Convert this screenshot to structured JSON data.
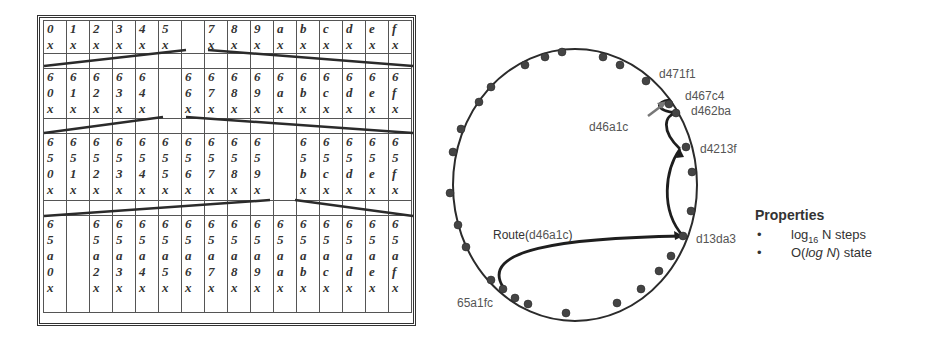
{
  "routing_table": {
    "columns": 16,
    "rows": [
      {
        "level": 0,
        "cells": [
          [
            "0",
            "x"
          ],
          [
            "1",
            "x"
          ],
          [
            "2",
            "x"
          ],
          [
            "3",
            "x"
          ],
          [
            "4",
            "x"
          ],
          [
            "5",
            "x"
          ],
          [],
          [
            "7",
            "x"
          ],
          [
            "8",
            "x"
          ],
          [
            "9",
            "x"
          ],
          [
            "a",
            "x"
          ],
          [
            "b",
            "x"
          ],
          [
            "c",
            "x"
          ],
          [
            "d",
            "x"
          ],
          [
            "e",
            "x"
          ],
          [
            "f",
            "x"
          ]
        ]
      },
      {
        "level": 1,
        "cells": [
          [
            "6",
            "0",
            "x"
          ],
          [
            "6",
            "1",
            "x"
          ],
          [
            "6",
            "2",
            "x"
          ],
          [
            "6",
            "3",
            "x"
          ],
          [
            "6",
            "4",
            "x"
          ],
          [],
          [
            "6",
            "6",
            "x"
          ],
          [
            "6",
            "7",
            "x"
          ],
          [
            "6",
            "8",
            "x"
          ],
          [
            "6",
            "9",
            "x"
          ],
          [
            "6",
            "a",
            "x"
          ],
          [
            "6",
            "b",
            "x"
          ],
          [
            "6",
            "c",
            "x"
          ],
          [
            "6",
            "d",
            "x"
          ],
          [
            "6",
            "e",
            "x"
          ],
          [
            "6",
            "f",
            "x"
          ]
        ]
      },
      {
        "level": 2,
        "cells": [
          [
            "6",
            "5",
            "0",
            "x"
          ],
          [
            "6",
            "5",
            "1",
            "x"
          ],
          [
            "6",
            "5",
            "2",
            "x"
          ],
          [
            "6",
            "5",
            "3",
            "x"
          ],
          [
            "6",
            "5",
            "4",
            "x"
          ],
          [
            "6",
            "5",
            "5",
            "x"
          ],
          [
            "6",
            "5",
            "6",
            "x"
          ],
          [
            "6",
            "5",
            "7",
            "x"
          ],
          [
            "6",
            "5",
            "8",
            "x"
          ],
          [
            "6",
            "5",
            "9",
            "x"
          ],
          [],
          [
            "6",
            "5",
            "b",
            "x"
          ],
          [
            "6",
            "5",
            "c",
            "x"
          ],
          [
            "6",
            "5",
            "d",
            "x"
          ],
          [
            "6",
            "5",
            "e",
            "x"
          ],
          [
            "6",
            "5",
            "f",
            "x"
          ]
        ]
      },
      {
        "level": 3,
        "cells": [
          [
            "6",
            "5",
            "a",
            "0",
            "x"
          ],
          [],
          [
            "6",
            "5",
            "a",
            "2",
            "x"
          ],
          [
            "6",
            "5",
            "a",
            "3",
            "x"
          ],
          [
            "6",
            "5",
            "a",
            "4",
            "x"
          ],
          [
            "6",
            "5",
            "a",
            "5",
            "x"
          ],
          [
            "6",
            "5",
            "a",
            "6",
            "x"
          ],
          [
            "6",
            "5",
            "a",
            "7",
            "x"
          ],
          [
            "6",
            "5",
            "a",
            "8",
            "x"
          ],
          [
            "6",
            "5",
            "a",
            "9",
            "x"
          ],
          [
            "6",
            "5",
            "a",
            "a",
            "x"
          ],
          [
            "6",
            "5",
            "a",
            "b",
            "x"
          ],
          [
            "6",
            "5",
            "a",
            "c",
            "x"
          ],
          [
            "6",
            "5",
            "a",
            "d",
            "x"
          ],
          [
            "6",
            "5",
            "a",
            "e",
            "x"
          ],
          [
            "6",
            "5",
            "a",
            "f",
            "x"
          ]
        ]
      }
    ]
  },
  "ring": {
    "node_labels": {
      "n1": "d471f1",
      "n2": "d467c4",
      "n3": "d462ba",
      "target": "d46a1c",
      "n4": "d4213f",
      "n5": "d13da3",
      "source": "65a1fc"
    },
    "route_label_prefix": "Route(",
    "route_label_key": "d46a1c",
    "route_label_suffix": ")"
  },
  "properties": {
    "title": "Properties",
    "items": [
      {
        "bullet": "•",
        "pre": "log",
        "sub": "16",
        "post": " N steps"
      },
      {
        "bullet": "•",
        "pre": "O(",
        "italic": "log N",
        "post": ") state"
      }
    ]
  },
  "colors": {
    "line": "#2b2b2b",
    "node": "#444444",
    "label": "#555555",
    "arrow": "#777777"
  }
}
